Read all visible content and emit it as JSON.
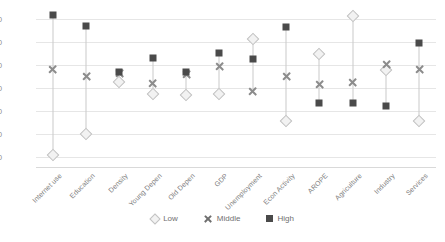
{
  "chart_data": {
    "type": "scatter",
    "title": "",
    "subtitle": "",
    "xlabel": "",
    "ylabel": "",
    "ylim": [
      -1.6,
      1.2
    ],
    "yticks": [
      1.0,
      0.6,
      0.2,
      -0.2,
      -0.6,
      -1.0,
      -1.4
    ],
    "ytick_labels": [
      "1.00",
      "0.60",
      "0.20",
      "-0.20",
      "-0.60",
      "-1.00",
      "-1.40"
    ],
    "grid": true,
    "legend_position": "bottom",
    "categories": [
      "Internet use",
      "Education",
      "Density",
      "Young Depen",
      "Old Depen",
      "GDP",
      "Unemployment",
      "Econ Activity",
      "AROPE",
      "Agriculture",
      "Industry",
      "Services"
    ],
    "series": [
      {
        "name": "Low",
        "marker": "diamond",
        "color": "#f2f2f2",
        "edge_color": "#c2c2c2",
        "values": [
          -1.38,
          -1.0,
          -0.1,
          -0.3,
          -0.32,
          -0.3,
          0.66,
          -0.78,
          0.4,
          1.06,
          0.12,
          -0.78
        ]
      },
      {
        "name": "Middle",
        "marker": "x",
        "color": "#8c8c8c",
        "values": [
          0.12,
          0.0,
          0.06,
          -0.12,
          0.04,
          0.18,
          -0.26,
          0.0,
          -0.14,
          -0.1,
          0.22,
          0.12
        ]
      },
      {
        "name": "High",
        "marker": "square",
        "color": "#4a4a4a",
        "values": [
          1.08,
          0.88,
          0.08,
          0.32,
          0.08,
          0.42,
          0.3,
          0.86,
          -0.46,
          -0.46,
          -0.52,
          0.58
        ]
      }
    ]
  },
  "legend": {
    "items": [
      {
        "label": "Low"
      },
      {
        "label": "Middle"
      },
      {
        "label": "High"
      }
    ]
  }
}
